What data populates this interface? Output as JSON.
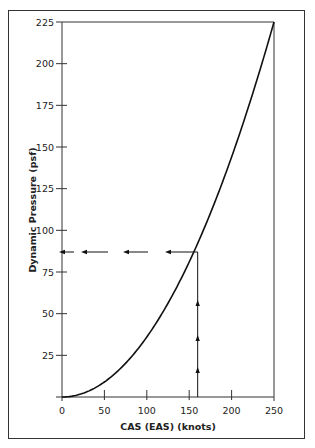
{
  "chart_data": {
    "type": "line",
    "title": "",
    "xlabel": "CAS (EAS)  (knots)",
    "ylabel": "Dynamic Pressure (psf)",
    "xlim": [
      0,
      250
    ],
    "ylim": [
      0,
      225
    ],
    "x_ticks": [
      0,
      50,
      100,
      150,
      200,
      250
    ],
    "y_ticks": [
      25,
      50,
      75,
      100,
      125,
      150,
      175,
      200,
      225
    ],
    "grid": false,
    "legend": null,
    "series": [
      {
        "name": "Dynamic Pressure",
        "x": [
          0,
          25,
          50,
          75,
          100,
          125,
          150,
          160,
          175,
          200,
          225,
          250
        ],
        "y": [
          0,
          2.3,
          9,
          20.3,
          36,
          56.3,
          81,
          92.2,
          110.3,
          144,
          182.3,
          225
        ]
      }
    ],
    "annotations": [
      {
        "type": "arrow-path",
        "description": "Vertical dashed arrows up from 160 knots to the curve",
        "x": 160,
        "from_y": 0,
        "to_y": 87
      },
      {
        "type": "arrow-path",
        "description": "Horizontal dashed arrows left from the curve to the Y axis",
        "y": 87,
        "from_x": 160,
        "to_x": 0
      }
    ],
    "reading_example": {
      "cas_knots": 160,
      "dynamic_pressure_psf": 87
    }
  }
}
